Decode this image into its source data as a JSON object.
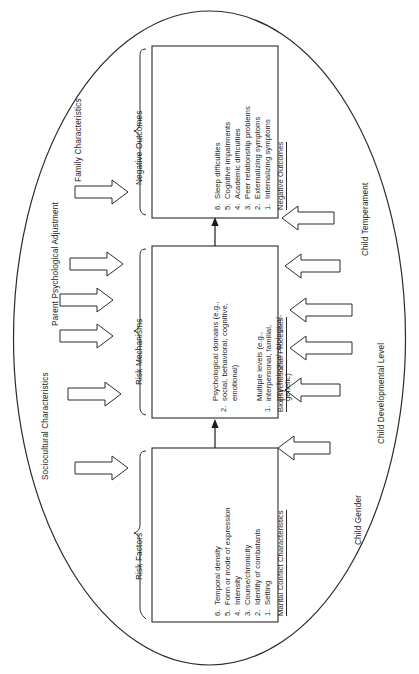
{
  "figure": {
    "type": "conceptual-model-diagram",
    "orientation": "rotated-90-degrees",
    "background_color": "#ffffff",
    "line_color": "#2b2b2b"
  },
  "boxes": [
    {
      "id": "marital-conflict-characteristics",
      "title": "Marital Conflict Characteristics",
      "items": [
        "Setting",
        "Identity of combatants",
        "Course/chronicity",
        "Intensity",
        "Form or mode of expression",
        "Temporal density"
      ]
    },
    {
      "id": "biopsychosocial-processes",
      "title": "Biopsychosocial Processes",
      "items": [
        "Multiple levels (e.g.,|interpersonal, familial,|psychological, biological,|genetic)",
        "Psychological domains (e.g.,|social, behavioral, cognitive,|emotional)"
      ]
    },
    {
      "id": "negative-outcomes",
      "title": "Negative Outcomes",
      "items": [
        "Internalizing symptoms",
        "Externalizing symptoms",
        "Peer relationship problems",
        "Academic difficulties",
        "Cognitive impairments",
        "Sleep difficulties"
      ]
    }
  ],
  "bracket_labels": [
    {
      "id": "risk-factors",
      "label": "Risk Factors"
    },
    {
      "id": "risk-mechanisms",
      "label": "Risk Mechanisms"
    },
    {
      "id": "negative-outcomes-bracket",
      "label": "Negative Outcomes"
    }
  ],
  "left_labels": [
    {
      "id": "sociocultural-characteristics",
      "label": "Sociocultural Characteristics"
    },
    {
      "id": "parent-psychological-adjustment",
      "label": "Parent Psychological Adjustment"
    },
    {
      "id": "family-characteristics",
      "label": "Family Characteristics"
    }
  ],
  "right_labels": [
    {
      "id": "child-gender",
      "label": "Child Gender"
    },
    {
      "id": "child-developmental-level",
      "label": "Child Developmental Level"
    },
    {
      "id": "child-temperament",
      "label": "Child Temperament"
    }
  ],
  "numbers": {
    "six": [
      "1.",
      "2.",
      "3.",
      "4.",
      "5.",
      "6."
    ],
    "two": [
      "1.",
      "2."
    ]
  },
  "arrows": {
    "left_count": 5,
    "right_count": 6,
    "connector_count": 2,
    "left_direction": "points-right-toward-boxes",
    "right_direction": "points-left-toward-boxes",
    "connector_direction": "points-up"
  }
}
